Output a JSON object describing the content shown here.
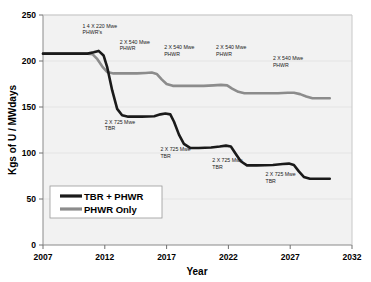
{
  "chart_data": {
    "type": "line",
    "title": "",
    "xlabel": "Year",
    "ylabel": "Kgs of U / MWdays",
    "xlim": [
      2007,
      2032
    ],
    "ylim": [
      0,
      250
    ],
    "xticks": [
      "2007",
      "2012",
      "2017",
      "2022",
      "2027",
      "2032"
    ],
    "xtick_values": [
      2007,
      2012,
      2017,
      2022,
      2027,
      2032
    ],
    "yticks": [
      "0",
      "50",
      "100",
      "150",
      "200",
      "250"
    ],
    "ytick_values": [
      0,
      50,
      100,
      150,
      200,
      250
    ],
    "grid": true,
    "legend_position": "lower-left-inside",
    "series": [
      {
        "name": "TBR + PHWR",
        "color": "#1a1a1a",
        "width": 2.6,
        "points": [
          [
            2007.0,
            208
          ],
          [
            2010.6,
            208
          ],
          [
            2011.1,
            209.5
          ],
          [
            2011.5,
            211
          ],
          [
            2011.9,
            206
          ],
          [
            2012.2,
            193
          ],
          [
            2012.6,
            168
          ],
          [
            2013.0,
            148
          ],
          [
            2013.4,
            141
          ],
          [
            2013.9,
            139.5
          ],
          [
            2015.0,
            139.5
          ],
          [
            2016.0,
            140
          ],
          [
            2016.5,
            142
          ],
          [
            2016.9,
            143
          ],
          [
            2017.3,
            142
          ],
          [
            2017.6,
            134
          ],
          [
            2018.0,
            120
          ],
          [
            2018.4,
            110
          ],
          [
            2018.9,
            105.5
          ],
          [
            2019.6,
            105.5
          ],
          [
            2020.6,
            106
          ],
          [
            2021.3,
            107
          ],
          [
            2021.8,
            108
          ],
          [
            2022.2,
            107
          ],
          [
            2022.6,
            99
          ],
          [
            2023.0,
            91
          ],
          [
            2023.5,
            86.5
          ],
          [
            2024.3,
            86.5
          ],
          [
            2025.6,
            87
          ],
          [
            2026.4,
            88
          ],
          [
            2026.9,
            88.5
          ],
          [
            2027.3,
            87
          ],
          [
            2027.7,
            80
          ],
          [
            2028.1,
            74
          ],
          [
            2028.6,
            72
          ],
          [
            2030.2,
            72
          ]
        ]
      },
      {
        "name": "PHWR Only",
        "color": "#8c8c8c",
        "width": 2.6,
        "points": [
          [
            2007.0,
            208
          ],
          [
            2010.6,
            208
          ],
          [
            2011.0,
            207.5
          ],
          [
            2011.4,
            202
          ],
          [
            2011.8,
            194
          ],
          [
            2012.2,
            188
          ],
          [
            2012.7,
            186.5
          ],
          [
            2013.5,
            186.5
          ],
          [
            2014.6,
            186.5
          ],
          [
            2015.3,
            187
          ],
          [
            2015.8,
            187.5
          ],
          [
            2016.2,
            186
          ],
          [
            2016.6,
            180
          ],
          [
            2017.0,
            175
          ],
          [
            2017.5,
            173
          ],
          [
            2018.6,
            173
          ],
          [
            2020.0,
            173
          ],
          [
            2020.8,
            173.5
          ],
          [
            2021.4,
            174
          ],
          [
            2021.9,
            173.5
          ],
          [
            2022.3,
            170
          ],
          [
            2022.8,
            166.5
          ],
          [
            2023.3,
            165
          ],
          [
            2024.5,
            165
          ],
          [
            2026.0,
            165
          ],
          [
            2026.8,
            165.5
          ],
          [
            2027.3,
            165.5
          ],
          [
            2027.8,
            164
          ],
          [
            2028.3,
            161.5
          ],
          [
            2028.8,
            159.5
          ],
          [
            2030.2,
            159.5
          ]
        ]
      }
    ],
    "annotations": [
      {
        "id": "annot-14x220-phwr",
        "line1": "1 4  X  220 Mwe",
        "line2": "PHWR's",
        "x": 2010.2,
        "y": 236
      },
      {
        "id": "annot-2x540-phwr-1",
        "line1": "2 X 540 Mwe",
        "line2": "PHWR",
        "x": 2013.2,
        "y": 219
      },
      {
        "id": "annot-2x725-tbr-1",
        "line1": "2 X 725 Mwe",
        "line2": "TBR",
        "x": 2012.0,
        "y": 132
      },
      {
        "id": "annot-2x540-phwr-2",
        "line1": "2 X 540 Mwe",
        "line2": "PHWR",
        "x": 2016.8,
        "y": 213
      },
      {
        "id": "annot-2x540-phwr-3",
        "line1": "2 X 540 Mwe",
        "line2": "PHWR",
        "x": 2021.0,
        "y": 213
      },
      {
        "id": "annot-2x540-phwr-4",
        "line1": "2 X 540 Mwe",
        "line2": "PHWR",
        "x": 2025.6,
        "y": 201
      },
      {
        "id": "annot-2x725-tbr-2",
        "line1": "2 X 725 Mwe",
        "line2": "TBR",
        "x": 2016.5,
        "y": 102
      },
      {
        "id": "annot-2x725-tbr-3",
        "line1": "2 X 725 Mwe",
        "line2": "TBR",
        "x": 2020.7,
        "y": 90
      },
      {
        "id": "annot-2x725-tbr-4",
        "line1": "2 X 725 Mwe",
        "line2": "TBR",
        "x": 2025.0,
        "y": 75
      }
    ],
    "legend": [
      {
        "label": "TBR + PHWR",
        "color": "#1a1a1a"
      },
      {
        "label": "PHWR Only",
        "color": "#8c8c8c"
      }
    ]
  },
  "colors": {
    "background": "#ffffff",
    "plot_background": "#f2f2f2",
    "axis": "#808080",
    "grid": "#e2e2e2",
    "series_tbr_phwr": "#1a1a1a",
    "series_phwr_only": "#8c8c8c"
  }
}
